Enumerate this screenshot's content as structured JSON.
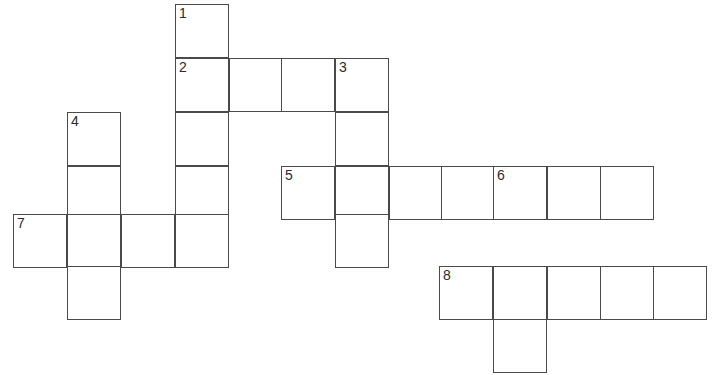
{
  "puzzle": {
    "title": "Crossword Puzzle Grid",
    "cell_size": 54,
    "border_color": "#4a4a4a",
    "cell_fill": "#ffffff",
    "background": "#ffffff",
    "number_color": "#2b2b2b",
    "grid_origin": {
      "x": 13,
      "y": 4
    },
    "clue_numbers": [
      "1",
      "2",
      "3",
      "4",
      "5",
      "6",
      "7",
      "8"
    ],
    "entries": [
      {
        "number": "1",
        "direction": "down",
        "length": 5,
        "start_col": 3,
        "start_row": 0
      },
      {
        "number": "2",
        "direction": "across",
        "length": 4,
        "start_col": 3,
        "start_row": 1
      },
      {
        "number": "3",
        "direction": "down",
        "length": 4,
        "start_col": 6,
        "start_row": 1
      },
      {
        "number": "4",
        "direction": "down",
        "length": 4,
        "start_col": 1,
        "start_row": 2
      },
      {
        "number": "5",
        "direction": "across",
        "length": 7,
        "start_col": 5,
        "start_row": 3
      },
      {
        "number": "6",
        "direction": "down",
        "length": 4,
        "start_col": 9,
        "start_row": 3
      },
      {
        "number": "7",
        "direction": "across",
        "length": 4,
        "start_col": 0,
        "start_row": 4
      },
      {
        "number": "8",
        "direction": "across",
        "length": 5,
        "start_col": 8,
        "start_row": 5
      }
    ],
    "cells": [
      {
        "name": "cell-r0c3",
        "x": 175,
        "y": 4,
        "number": "1",
        "letter": ""
      },
      {
        "name": "cell-r1c3",
        "x": 175,
        "y": 58,
        "number": "2",
        "letter": ""
      },
      {
        "name": "cell-r1c4",
        "x": 229,
        "y": 58,
        "number": "",
        "letter": ""
      },
      {
        "name": "cell-r1c5",
        "x": 281,
        "y": 58,
        "number": "",
        "letter": ""
      },
      {
        "name": "cell-r1c6",
        "x": 335,
        "y": 58,
        "number": "3",
        "letter": ""
      },
      {
        "name": "cell-r2c1",
        "x": 67,
        "y": 112,
        "number": "4",
        "letter": ""
      },
      {
        "name": "cell-r2c3",
        "x": 175,
        "y": 112,
        "number": "",
        "letter": ""
      },
      {
        "name": "cell-r2c6",
        "x": 335,
        "y": 112,
        "number": "",
        "letter": ""
      },
      {
        "name": "cell-r3c1",
        "x": 67,
        "y": 166,
        "number": "",
        "letter": ""
      },
      {
        "name": "cell-r3c3",
        "x": 175,
        "y": 166,
        "number": "",
        "letter": ""
      },
      {
        "name": "cell-r3c5",
        "x": 281,
        "y": 166,
        "number": "5",
        "letter": ""
      },
      {
        "name": "cell-r3c6",
        "x": 335,
        "y": 166,
        "number": "",
        "letter": ""
      },
      {
        "name": "cell-r3c7",
        "x": 389,
        "y": 166,
        "number": "",
        "letter": ""
      },
      {
        "name": "cell-r3c8",
        "x": 441,
        "y": 166,
        "number": "",
        "letter": ""
      },
      {
        "name": "cell-r3c9",
        "x": 493,
        "y": 166,
        "number": "6",
        "letter": ""
      },
      {
        "name": "cell-r3c10",
        "x": 547,
        "y": 166,
        "number": "",
        "letter": ""
      },
      {
        "name": "cell-r3c11",
        "x": 600,
        "y": 166,
        "number": "",
        "letter": ""
      },
      {
        "name": "cell-r4c0",
        "x": 13,
        "y": 214,
        "number": "7",
        "letter": ""
      },
      {
        "name": "cell-r4c1",
        "x": 67,
        "y": 214,
        "number": "",
        "letter": ""
      },
      {
        "name": "cell-r4c2",
        "x": 121,
        "y": 214,
        "number": "",
        "letter": ""
      },
      {
        "name": "cell-r4c3",
        "x": 175,
        "y": 214,
        "number": "",
        "letter": ""
      },
      {
        "name": "cell-r4c6",
        "x": 335,
        "y": 214,
        "number": "",
        "letter": ""
      },
      {
        "name": "cell-r5c1",
        "x": 67,
        "y": 266,
        "number": "",
        "letter": ""
      },
      {
        "name": "cell-r5c8",
        "x": 439,
        "y": 266,
        "number": "8",
        "letter": ""
      },
      {
        "name": "cell-r5c9",
        "x": 493,
        "y": 266,
        "number": "",
        "letter": ""
      },
      {
        "name": "cell-r5c10",
        "x": 547,
        "y": 266,
        "number": "",
        "letter": ""
      },
      {
        "name": "cell-r5c11",
        "x": 600,
        "y": 266,
        "number": "",
        "letter": ""
      },
      {
        "name": "cell-r5c12",
        "x": 653,
        "y": 266,
        "number": "",
        "letter": ""
      },
      {
        "name": "cell-r6c9",
        "x": 493,
        "y": 319,
        "number": "",
        "letter": ""
      }
    ]
  }
}
